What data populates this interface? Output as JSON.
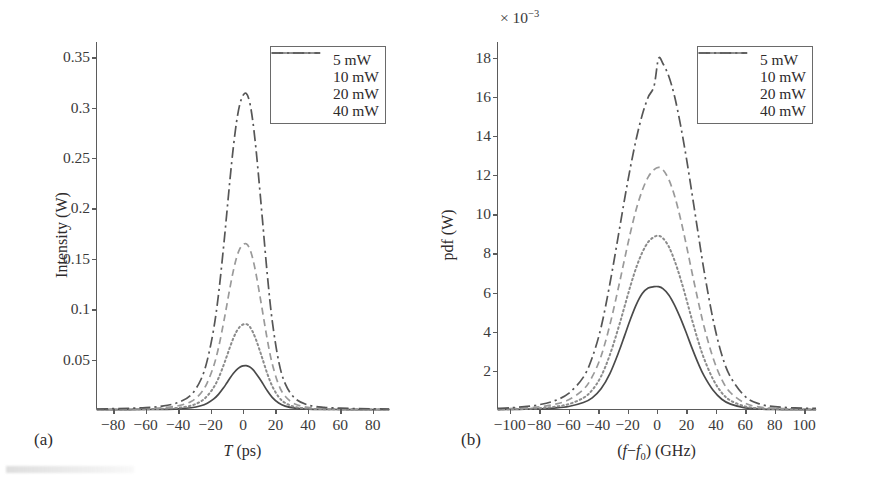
{
  "figure": {
    "panels": [
      {
        "tag": "(a)",
        "xlabel_html": "<span class=\"ital\">T</span> (ps)",
        "ylabel": "Intensity (W)",
        "exponent_html": "",
        "xticks": [
          "−80",
          "−60",
          "−40",
          "−20",
          "0",
          "20",
          "40",
          "60",
          "80"
        ],
        "yticks": [
          "0.05",
          "0.1",
          "0.15",
          "0.2",
          "0.25",
          "0.3",
          "0.35"
        ]
      },
      {
        "tag": "(b)",
        "xlabel_html": "(<span class=\"ital\">f</span>−<span class=\"ital\">f</span><sub>0</sub>) (GHz)",
        "ylabel": "pdf (W)",
        "exponent_html": "× 10<sup>−3</sup>",
        "xticks": [
          "−100",
          "−80",
          "−60",
          "−40",
          "−20",
          "0",
          "20",
          "40",
          "60",
          "80",
          "100"
        ],
        "yticks": [
          "2",
          "4",
          "6",
          "8",
          "10",
          "12",
          "14",
          "16",
          "18"
        ]
      }
    ],
    "legend": {
      "entries": [
        {
          "label": "5 mW",
          "style": "solid",
          "color": "#4a4a4a"
        },
        {
          "label": "10 mW",
          "style": "dotted",
          "color": "#8c8c8c"
        },
        {
          "label": "20 mW",
          "style": "dashed",
          "color": "#9a9a9a"
        },
        {
          "label": "40 mW",
          "style": "dashdot",
          "color": "#565656"
        }
      ]
    }
  },
  "chart_data": [
    {
      "type": "line",
      "panel": "(a)",
      "title": "",
      "xlabel": "T (ps)",
      "ylabel": "Intensity (W)",
      "xlim": [
        -90,
        90
      ],
      "ylim": [
        0,
        0.365
      ],
      "xticks": [
        -80,
        -60,
        -40,
        -20,
        0,
        20,
        40,
        60,
        80
      ],
      "yticks": [
        0.05,
        0.1,
        0.15,
        0.2,
        0.25,
        0.3,
        0.35
      ],
      "grid": false,
      "legend_position": "upper right",
      "y_exponent": 1,
      "series": [
        {
          "name": "5 mW",
          "style": "solid",
          "color": "#4a4a4a",
          "peak_x": 0.5,
          "peak_y": 0.044,
          "fwhm": 17.0,
          "x": [
            -90,
            -80,
            -70,
            -60,
            -50,
            -40,
            -32,
            -26,
            -22,
            -18,
            -15,
            -12,
            -10,
            -8,
            -6,
            -4,
            -2,
            0,
            2,
            4,
            6,
            8,
            10,
            12,
            15,
            18,
            22,
            26,
            32,
            40,
            50,
            60,
            70,
            80,
            90
          ],
          "y": [
            0.0003,
            0.0004,
            0.0004,
            0.0005,
            0.0007,
            0.0012,
            0.0022,
            0.0042,
            0.0068,
            0.011,
            0.0158,
            0.022,
            0.0268,
            0.0317,
            0.0362,
            0.0399,
            0.0425,
            0.0438,
            0.044,
            0.0428,
            0.0402,
            0.0363,
            0.0317,
            0.0268,
            0.019,
            0.0126,
            0.0069,
            0.0038,
            0.0018,
            0.0009,
            0.0006,
            0.0005,
            0.0004,
            0.0004,
            0.0003
          ]
        },
        {
          "name": "10 mW",
          "style": "dotted",
          "color": "#8c8c8c",
          "peak_x": 0.5,
          "peak_y": 0.088,
          "fwhm": 15.5,
          "x": [
            -90,
            -80,
            -70,
            -60,
            -50,
            -40,
            -32,
            -26,
            -22,
            -18,
            -15,
            -12,
            -10,
            -8,
            -6,
            -4,
            -2,
            0,
            2,
            4,
            6,
            8,
            10,
            12,
            15,
            18,
            22,
            26,
            32,
            40,
            50,
            60,
            70,
            80,
            90
          ],
          "y": [
            0.0004,
            0.0005,
            0.0006,
            0.0008,
            0.0012,
            0.0022,
            0.0043,
            0.0085,
            0.014,
            0.0226,
            0.032,
            0.0443,
            0.0533,
            0.0625,
            0.071,
            0.0779,
            0.0824,
            0.0848,
            0.0852,
            0.0829,
            0.0776,
            0.0699,
            0.0606,
            0.0508,
            0.036,
            0.0238,
            0.0129,
            0.007,
            0.0031,
            0.0014,
            0.0008,
            0.0006,
            0.0005,
            0.0004,
            0.0004
          ]
        },
        {
          "name": "20 mW",
          "style": "dashed",
          "color": "#9a9a9a",
          "peak_x": 0.5,
          "peak_y": 0.175,
          "fwhm": 14.0,
          "x": [
            -90,
            -80,
            -70,
            -60,
            -50,
            -40,
            -32,
            -26,
            -22,
            -18,
            -15,
            -12,
            -10,
            -8,
            -6,
            -4,
            -2,
            0,
            2,
            4,
            6,
            8,
            10,
            12,
            15,
            18,
            22,
            26,
            32,
            40,
            50,
            60,
            70,
            80,
            90
          ],
          "y": [
            0.0006,
            0.0008,
            0.001,
            0.0014,
            0.0022,
            0.0042,
            0.0084,
            0.0166,
            0.0272,
            0.044,
            0.0624,
            0.0864,
            0.1038,
            0.1216,
            0.1378,
            0.151,
            0.1598,
            0.164,
            0.1648,
            0.1604,
            0.1502,
            0.1352,
            0.1172,
            0.0982,
            0.0696,
            0.046,
            0.025,
            0.0136,
            0.006,
            0.0026,
            0.0014,
            0.001,
            0.0008,
            0.0007,
            0.0006
          ]
        },
        {
          "name": "40 mW",
          "style": "dashdot",
          "color": "#565656",
          "peak_x": 0.5,
          "peak_y": 0.35,
          "fwhm": 12.5,
          "x": [
            -90,
            -80,
            -70,
            -60,
            -50,
            -40,
            -32,
            -26,
            -22,
            -18,
            -15,
            -12,
            -10,
            -8,
            -6,
            -4,
            -2,
            0,
            2,
            4,
            6,
            8,
            10,
            12,
            15,
            18,
            22,
            26,
            32,
            40,
            50,
            60,
            70,
            80,
            90
          ],
          "y": [
            0.001,
            0.0013,
            0.0017,
            0.0024,
            0.0038,
            0.0074,
            0.015,
            0.03,
            0.0495,
            0.081,
            0.116,
            0.1615,
            0.195,
            0.229,
            0.26,
            0.2855,
            0.303,
            0.312,
            0.314,
            0.306,
            0.287,
            0.259,
            0.2248,
            0.1885,
            0.134,
            0.0886,
            0.0482,
            0.0262,
            0.0116,
            0.005,
            0.0026,
            0.0018,
            0.0014,
            0.0012,
            0.001
          ]
        }
      ]
    },
    {
      "type": "line",
      "panel": "(b)",
      "title": "",
      "xlabel": "(f-f0) (GHz)",
      "ylabel": "pdf (W)",
      "xlim": [
        -108,
        108
      ],
      "ylim": [
        0,
        18.8
      ],
      "xticks": [
        -100,
        -80,
        -60,
        -40,
        -20,
        0,
        20,
        40,
        60,
        80,
        100
      ],
      "yticks": [
        2,
        4,
        6,
        8,
        10,
        12,
        14,
        16,
        18
      ],
      "grid": false,
      "legend_position": "upper right",
      "y_exponent": -3,
      "series": [
        {
          "name": "5 mW",
          "style": "solid",
          "color": "#4a4a4a",
          "peak_x": 1.0,
          "peak_y": 6.3,
          "fwhm": 30.0,
          "x": [
            -108,
            -100,
            -90,
            -80,
            -70,
            -60,
            -50,
            -44,
            -38,
            -32,
            -26,
            -22,
            -18,
            -14,
            -10,
            -6,
            -2,
            1,
            4,
            8,
            12,
            16,
            20,
            24,
            28,
            32,
            38,
            44,
            50,
            60,
            70,
            80,
            90,
            100,
            108
          ],
          "y": [
            0.02,
            0.03,
            0.04,
            0.06,
            0.1,
            0.18,
            0.38,
            0.62,
            1.08,
            1.86,
            2.96,
            3.8,
            4.65,
            5.4,
            5.95,
            6.23,
            6.3,
            6.3,
            6.2,
            5.88,
            5.35,
            4.68,
            3.92,
            3.12,
            2.38,
            1.74,
            1.02,
            0.55,
            0.3,
            0.11,
            0.05,
            0.03,
            0.02,
            0.02,
            0.02
          ]
        },
        {
          "name": "10 mW",
          "style": "dotted",
          "color": "#8c8c8c",
          "peak_x": 1.0,
          "peak_y": 8.9,
          "fwhm": 29.0,
          "x": [
            -108,
            -100,
            -90,
            -80,
            -70,
            -60,
            -50,
            -44,
            -38,
            -32,
            -26,
            -22,
            -18,
            -14,
            -10,
            -6,
            -2,
            1,
            4,
            8,
            12,
            16,
            20,
            24,
            28,
            32,
            38,
            44,
            50,
            60,
            70,
            80,
            90,
            100,
            108
          ],
          "y": [
            0.03,
            0.04,
            0.06,
            0.09,
            0.16,
            0.3,
            0.62,
            1.02,
            1.72,
            2.82,
            4.25,
            5.3,
            6.35,
            7.3,
            8.05,
            8.58,
            8.84,
            8.9,
            8.78,
            8.35,
            7.62,
            6.7,
            5.65,
            4.55,
            3.52,
            2.62,
            1.58,
            0.88,
            0.48,
            0.18,
            0.08,
            0.05,
            0.04,
            0.03,
            0.03
          ]
        },
        {
          "name": "20 mW",
          "style": "dashed",
          "color": "#9a9a9a",
          "peak_x": 1.0,
          "peak_y": 12.4,
          "fwhm": 31.5,
          "x": [
            -108,
            -100,
            -90,
            -80,
            -70,
            -60,
            -50,
            -44,
            -38,
            -32,
            -26,
            -22,
            -18,
            -14,
            -10,
            -6,
            -2,
            1,
            4,
            8,
            12,
            16,
            20,
            24,
            28,
            32,
            38,
            44,
            50,
            60,
            70,
            80,
            90,
            100,
            108
          ],
          "y": [
            0.05,
            0.07,
            0.1,
            0.16,
            0.28,
            0.52,
            1.05,
            1.7,
            2.75,
            4.35,
            6.32,
            7.72,
            9.08,
            10.28,
            11.22,
            11.9,
            12.28,
            12.4,
            12.28,
            11.78,
            10.92,
            9.76,
            8.4,
            6.95,
            5.55,
            4.25,
            2.68,
            1.55,
            0.88,
            0.34,
            0.15,
            0.09,
            0.07,
            0.05,
            0.05
          ]
        },
        {
          "name": "40 mW",
          "style": "dashdot",
          "color": "#565656",
          "peak_x": 1.0,
          "peak_y": 18.0,
          "fwhm": 34.0,
          "x": [
            -108,
            -100,
            -90,
            -80,
            -70,
            -60,
            -50,
            -44,
            -38,
            -32,
            -26,
            -22,
            -18,
            -14,
            -10,
            -6,
            -2,
            1,
            4,
            8,
            12,
            16,
            20,
            24,
            28,
            32,
            38,
            44,
            50,
            60,
            70,
            80,
            90,
            100,
            108
          ],
          "y": [
            0.08,
            0.11,
            0.17,
            0.27,
            0.46,
            0.85,
            1.68,
            2.68,
            4.22,
            6.45,
            9.02,
            10.78,
            12.42,
            13.88,
            15.08,
            15.98,
            16.55,
            17.95,
            17.7,
            17.05,
            16.0,
            14.55,
            12.85,
            10.95,
            9.0,
            7.1,
            4.65,
            2.82,
            1.68,
            0.68,
            0.3,
            0.17,
            0.12,
            0.09,
            0.08
          ]
        }
      ]
    }
  ]
}
